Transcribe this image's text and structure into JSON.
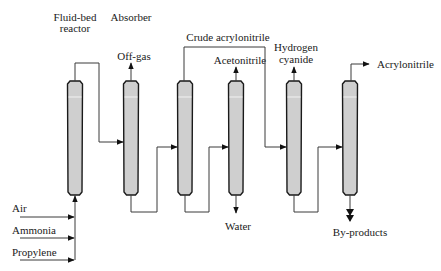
{
  "diagram": {
    "units": {
      "reactor": {
        "line1": "Fluid-bed",
        "line2": "reactor"
      },
      "absorber": {
        "label": "Absorber"
      }
    },
    "feeds": [
      {
        "label": "Air"
      },
      {
        "label": "Ammonia"
      },
      {
        "label": "Propylene"
      }
    ],
    "streams": {
      "off_gas": "Off-gas",
      "crude_acrylonitrile": "Crude acrylonitrile",
      "acetonitrile": "Acetonitrile",
      "hydrogen_cyanide": {
        "line1": "Hydrogen",
        "line2": "cyanide"
      },
      "acrylonitrile": "Acrylonitrile",
      "water": "Water",
      "by_products": "By-products"
    },
    "colors": {
      "column_fill": "#cfcfcf",
      "column_stroke": "#1a1a1a",
      "line": "#3a3a3a",
      "background": "#ffffff"
    }
  }
}
